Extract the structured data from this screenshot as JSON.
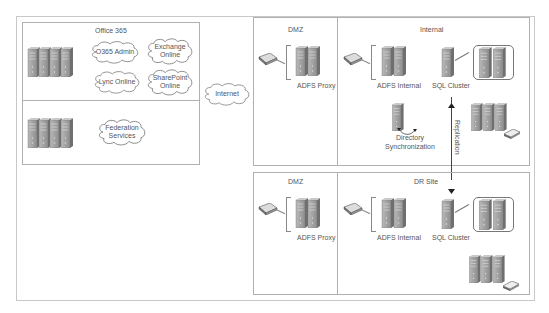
{
  "diagram": {
    "office365": {
      "label": "Office 365",
      "services": [
        "O365 Admin",
        "Exchange Online",
        "Lync Online",
        "SharePoint Online"
      ],
      "federation": "Federation Services"
    },
    "internet": {
      "label": "Internet"
    },
    "primary": {
      "dmz": {
        "label": "DMZ",
        "server": "ADFS Proxy"
      },
      "internal": {
        "label": "Internal",
        "adfs": "ADFS Internal",
        "sql": "SQL Cluster",
        "dirsync": "Directory Synchronization"
      }
    },
    "replication": {
      "label": "Replication"
    },
    "dr": {
      "dmz": {
        "label": "DMZ",
        "server": "ADFS Proxy"
      },
      "site": {
        "label": "DR Site",
        "adfs": "ADFS Internal",
        "sql": "SQL Cluster"
      }
    },
    "colors": {
      "border": "#b0b0b0",
      "server_front": "#9a9a9a",
      "server_side": "#6f6f6f",
      "cloud_stroke": "#888888"
    }
  }
}
